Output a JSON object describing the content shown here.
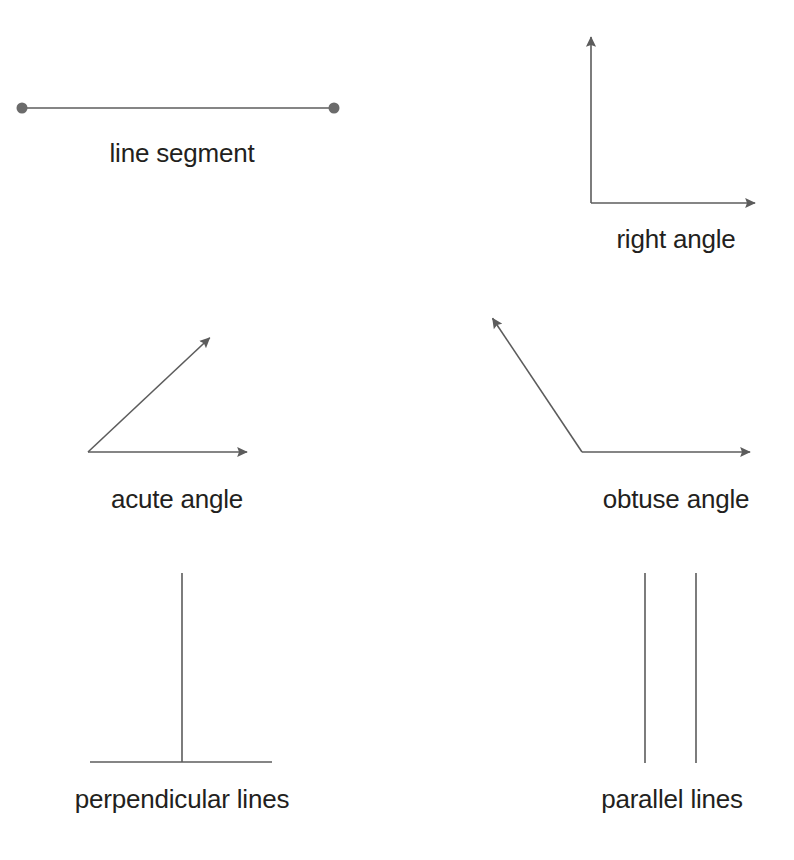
{
  "page": {
    "background_color": "#ffffff",
    "width": 794,
    "height": 860
  },
  "style": {
    "stroke_color": "#5c5c5c",
    "stroke_width": 1.6,
    "endpoint_dot_color": "#6b6b6b",
    "label_color": "#231f20",
    "label_font_size": 26
  },
  "figures": {
    "line_segment": {
      "label": "line segment",
      "label_x": 182,
      "label_y": 140,
      "type": "segment",
      "start": {
        "x": 22,
        "y": 108
      },
      "end": {
        "x": 334,
        "y": 108
      },
      "endpoint_radius": 5.5,
      "has_endpoints": true
    },
    "right_angle": {
      "label": "right angle",
      "label_x": 676,
      "label_y": 226,
      "type": "angle",
      "vertex": {
        "x": 591,
        "y": 203
      },
      "ray_1_tip": {
        "x": 591,
        "y": 27
      },
      "ray_2_tip": {
        "x": 765,
        "y": 203
      },
      "angle_degrees": 90
    },
    "acute_angle": {
      "label": "acute angle",
      "label_x": 177,
      "label_y": 486,
      "type": "angle",
      "vertex": {
        "x": 88,
        "y": 452
      },
      "ray_1_tip": {
        "x": 217,
        "y": 331
      },
      "ray_2_tip": {
        "x": 257,
        "y": 452
      },
      "angle_degrees": 43
    },
    "obtuse_angle": {
      "label": "obtuse angle",
      "label_x": 676,
      "label_y": 486,
      "type": "angle",
      "vertex": {
        "x": 582,
        "y": 452
      },
      "ray_1_tip": {
        "x": 487,
        "y": 310
      },
      "ray_2_tip": {
        "x": 760,
        "y": 452
      },
      "angle_degrees": 124
    },
    "perpendicular_lines": {
      "label": "perpendicular lines",
      "label_x": 182,
      "label_y": 786,
      "type": "two-lines",
      "line_1": {
        "x1": 182,
        "y1": 573,
        "x2": 182,
        "y2": 762
      },
      "line_2": {
        "x1": 90,
        "y1": 762,
        "x2": 272,
        "y2": 762
      }
    },
    "parallel_lines": {
      "label": "parallel lines",
      "label_x": 672,
      "label_y": 786,
      "type": "two-lines",
      "line_1": {
        "x1": 645,
        "y1": 573,
        "x2": 645,
        "y2": 763
      },
      "line_2": {
        "x1": 696,
        "y1": 573,
        "x2": 696,
        "y2": 763
      }
    }
  }
}
